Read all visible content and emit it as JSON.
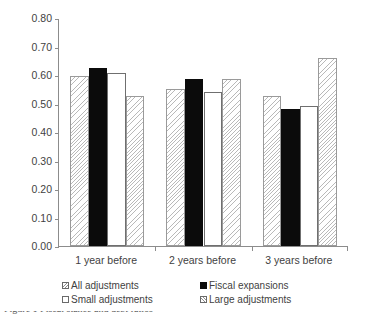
{
  "chart_data": {
    "type": "bar",
    "title": "",
    "subtitle": "",
    "xlabel": "",
    "ylabel": "",
    "categories": [
      "1 year before",
      "2 years before",
      "3 years before"
    ],
    "ylim": [
      0.0,
      0.8
    ],
    "ytick_labels": [
      "0.80",
      "0.70",
      "0.60",
      "0.50",
      "0.40",
      "0.30",
      "0.20",
      "0.10",
      "0.00"
    ],
    "ytick_values": [
      0.8,
      0.7,
      0.6,
      0.5,
      0.4,
      0.3,
      0.2,
      0.1,
      0.0
    ],
    "grid": false,
    "legend_position": "below-axis",
    "series": [
      {
        "name": "All adjustments",
        "fill": "diagonal-hatch",
        "values": [
          0.595,
          0.552,
          0.525
        ]
      },
      {
        "name": "Fiscal expansions",
        "fill": "solid-black",
        "values": [
          0.625,
          0.585,
          0.482
        ]
      },
      {
        "name": "Small adjustments",
        "fill": "white",
        "values": [
          0.608,
          0.54,
          0.492
        ]
      },
      {
        "name": "Large adjustments",
        "fill": "diagonal-hatch",
        "values": [
          0.525,
          0.585,
          0.66
        ]
      }
    ]
  },
  "legend": {
    "entries": [
      {
        "label": "All adjustments",
        "swatch": "hatch"
      },
      {
        "label": "Fiscal expansions",
        "swatch": "solid"
      },
      {
        "label": "Small adjustments",
        "swatch": "open"
      },
      {
        "label": "Large adjustments",
        "swatch": "hatch-fwd"
      }
    ]
  },
  "caption": {
    "clipped_text": "Figure 1 Fiscal stance and debt ratios"
  },
  "colors": {
    "axis": "#8c8c8c",
    "solid_bar": "#0b0b0b",
    "hatch_line": "#b9b9b9",
    "text": "#3f3f3f",
    "background": "#ffffff"
  }
}
